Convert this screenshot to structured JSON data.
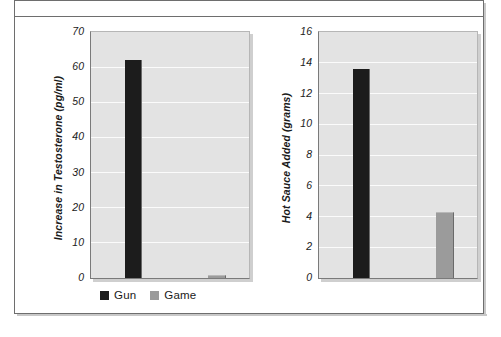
{
  "figure": {
    "frame_border_color": "#6e6e6e",
    "plot_background_color": "#e3e3e3",
    "gridline_color": "#fbfbfb"
  },
  "legend": {
    "items": [
      {
        "label": "Gun",
        "color": "#1c1c1c",
        "swatch_name": "legend-swatch-gun"
      },
      {
        "label": "Game",
        "color": "#9b9b9b",
        "swatch_name": "legend-swatch-game"
      }
    ]
  },
  "chart_data": [
    {
      "type": "bar",
      "title": "",
      "xlabel": "",
      "ylabel": "Increase in Testosterone (pg/ml)",
      "ylim": [
        0,
        70
      ],
      "yticks": [
        0,
        10,
        20,
        30,
        40,
        50,
        60,
        70
      ],
      "ytick_labels": [
        "0",
        "10",
        "20",
        "30",
        "40",
        "50",
        "60",
        "70"
      ],
      "grid": true,
      "legend_position": "below",
      "categories": [
        "Gun",
        "Game"
      ],
      "values": [
        62,
        0.7
      ],
      "colors": [
        "#1c1c1c",
        "#9b9b9b"
      ]
    },
    {
      "type": "bar",
      "title": "",
      "xlabel": "",
      "ylabel": "Hot Sauce Added (grams)",
      "ylim": [
        0,
        16
      ],
      "yticks": [
        0,
        2,
        4,
        6,
        8,
        10,
        12,
        14,
        16
      ],
      "ytick_labels": [
        "0",
        "2",
        "4",
        "6",
        "8",
        "10",
        "12",
        "14",
        "16"
      ],
      "grid": true,
      "legend_position": "none",
      "categories": [
        "Gun",
        "Game"
      ],
      "values": [
        13.6,
        4.2
      ],
      "colors": [
        "#1c1c1c",
        "#9b9b9b"
      ]
    }
  ]
}
